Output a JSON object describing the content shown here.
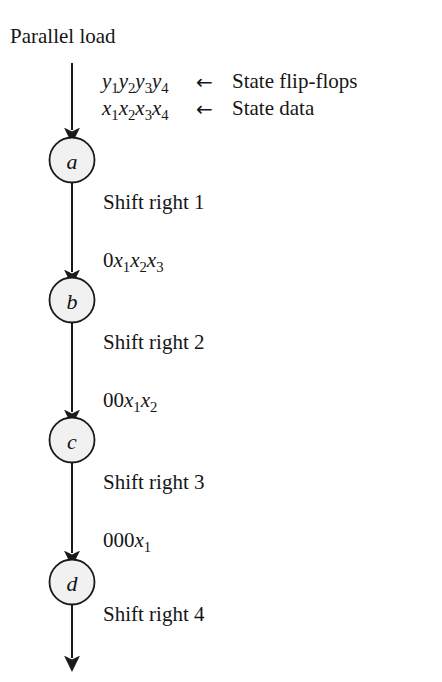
{
  "diagram": {
    "title_text": "Parallel load",
    "annotations": [
      {
        "id": "state-flip-flops",
        "symbols": "y1y2y3y4",
        "arrow": "←",
        "label": "State flip-flops"
      },
      {
        "id": "state-data",
        "symbols": "x1x2x3x4",
        "arrow": "←",
        "label": "State data"
      }
    ],
    "nodes": [
      {
        "id": "node-a",
        "label": "a"
      },
      {
        "id": "node-b",
        "label": "b"
      },
      {
        "id": "node-c",
        "label": "c"
      },
      {
        "id": "node-d",
        "label": "d"
      }
    ],
    "transitions": [
      {
        "id": "shift-1",
        "action": "Shift right 1",
        "value": "0x1x2x3"
      },
      {
        "id": "shift-2",
        "action": "Shift right 2",
        "value": "00x1x2"
      },
      {
        "id": "shift-3",
        "action": "Shift right 3",
        "value": "000x1"
      },
      {
        "id": "shift-4",
        "action": "Shift right 4",
        "value": ""
      }
    ],
    "colors": {
      "node_fill": "#f1f1f1",
      "node_stroke": "#1a1a1a",
      "edge": "#1a1a1a",
      "text": "#161616",
      "background": "#ffffff"
    }
  }
}
